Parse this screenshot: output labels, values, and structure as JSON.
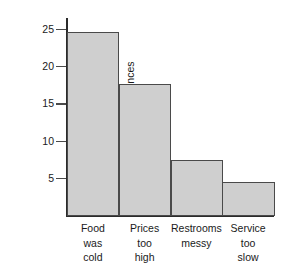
{
  "chart_data": {
    "type": "bar",
    "title": "",
    "xlabel": "",
    "ylabel": "Number of occurrences",
    "categories": [
      "Food was cold",
      "Prices too high",
      "Restrooms messy",
      "Service too slow"
    ],
    "category_lines": [
      [
        "Food",
        "was",
        "cold"
      ],
      [
        "Prices",
        "too",
        "high"
      ],
      [
        "Restrooms",
        "messy"
      ],
      [
        "Service",
        "too",
        "slow"
      ]
    ],
    "values": [
      24.6,
      17.7,
      7.5,
      4.6
    ],
    "ylim": [
      0,
      26.5
    ],
    "yticks": [
      5,
      10,
      15,
      20,
      25
    ],
    "ytick_labels": [
      "5",
      "10",
      "15",
      "20",
      "25"
    ],
    "grid": false,
    "legend": null,
    "bar_fill_color": "#cfcfcf",
    "bar_edge_color": "#4a4a4a",
    "axis_color": "#2b2b2b",
    "background_color": "#ffffff"
  }
}
